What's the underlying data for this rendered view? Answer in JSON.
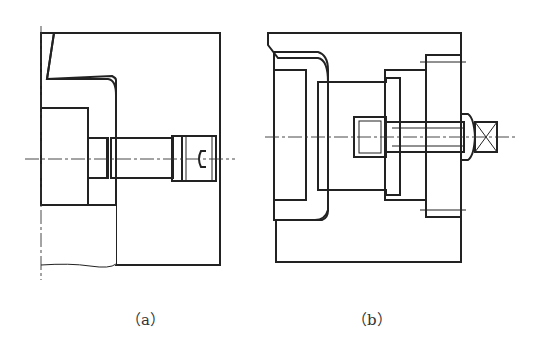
{
  "figure": {
    "type": "mechanical-section-drawing",
    "panels": [
      {
        "id": "a",
        "caption": "（a）",
        "description": "Cross-section with cross-hatched insert and pin with slotted screw head on centerline"
      },
      {
        "id": "b",
        "caption": "（b）",
        "description": "Cross-section with cross-hatched liner, inner hatched block, socket-head bolt through right plate"
      }
    ],
    "colors": {
      "line": "#222222",
      "background": "#ffffff"
    }
  }
}
